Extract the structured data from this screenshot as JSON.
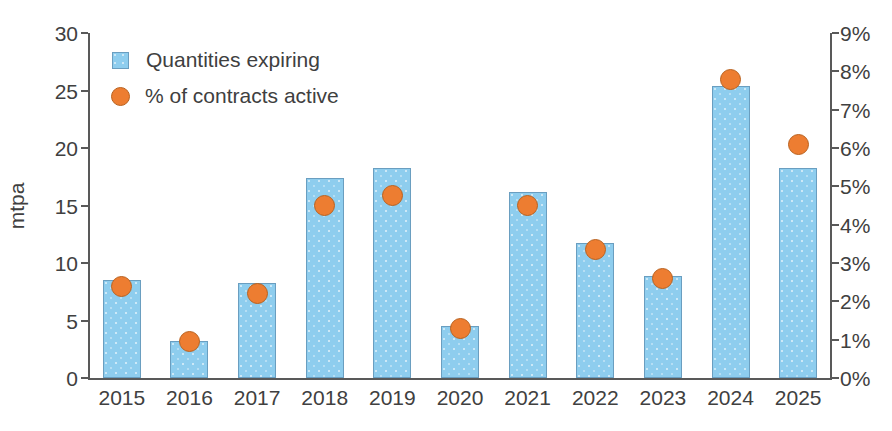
{
  "chart_data": {
    "type": "bar",
    "title": "",
    "subtitle": "",
    "xlabel": "",
    "ylabel": "mtpa",
    "ylabel_right": "",
    "categories": [
      "2015",
      "2016",
      "2017",
      "2018",
      "2019",
      "2020",
      "2021",
      "2022",
      "2023",
      "2024",
      "2025"
    ],
    "series": [
      {
        "name": "Quantities expiring",
        "type": "bar",
        "axis": "left",
        "unit": "mtpa",
        "color": "#8ecdee",
        "values": [
          8.5,
          3.2,
          8.3,
          17.4,
          18.3,
          4.5,
          16.2,
          11.7,
          8.9,
          25.4,
          18.3
        ]
      },
      {
        "name": "% of contracts active",
        "type": "scatter",
        "axis": "right",
        "unit": "%",
        "color": "#ed7d31",
        "values": [
          2.4,
          0.95,
          2.2,
          4.5,
          4.75,
          1.3,
          4.5,
          3.35,
          2.6,
          7.8,
          6.1
        ]
      }
    ],
    "ylim": [
      0,
      30
    ],
    "yticks": [
      0,
      5,
      10,
      15,
      20,
      25,
      30
    ],
    "ytick_labels": [
      "0",
      "5",
      "10",
      "15",
      "20",
      "25",
      "30"
    ],
    "ylim_right": [
      0,
      9
    ],
    "yticks_right": [
      0,
      1,
      2,
      3,
      4,
      5,
      6,
      7,
      8,
      9
    ],
    "ytick_labels_right": [
      "0%",
      "1%",
      "2%",
      "3%",
      "4%",
      "5%",
      "6%",
      "7%",
      "8%",
      "9%"
    ],
    "grid": false,
    "legend_position": "top-left",
    "legend": [
      "Quantities expiring",
      "% of contracts active"
    ]
  }
}
